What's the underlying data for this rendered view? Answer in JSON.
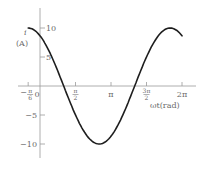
{
  "chart_data": {
    "type": "line",
    "title": "",
    "xlabel": "ωt(rad)",
    "ylabel": "i (A)",
    "ylabel_symbol": "i",
    "ylabel_unit": "(A)",
    "function": "i = 10 cos(ωt + π/6)",
    "xlim": [
      -0.5236,
      6.2832
    ],
    "ylim": [
      -12,
      13
    ],
    "x_ticks": [
      {
        "value": -0.5236,
        "label": "−π/6",
        "num": "π",
        "den": "6",
        "neg": true
      },
      {
        "value": 0,
        "label": "0"
      },
      {
        "value": 1.5708,
        "label": "π/2",
        "num": "π",
        "den": "2"
      },
      {
        "value": 3.1416,
        "label": "π"
      },
      {
        "value": 4.7124,
        "label": "3π/2",
        "num": "3π",
        "den": "2"
      },
      {
        "value": 6.2832,
        "label": "2π"
      }
    ],
    "y_ticks": [
      {
        "value": 10,
        "label": "10"
      },
      {
        "value": 5,
        "label": "5"
      },
      {
        "value": -5,
        "label": "−5"
      },
      {
        "value": -10,
        "label": "−10"
      }
    ],
    "series": [
      {
        "name": "i",
        "amplitude": 10,
        "phase": 0.5236,
        "x": [
          -0.5236,
          0,
          0.5236,
          1.0472,
          1.5708,
          2.0944,
          2.618,
          3.1416,
          3.6652,
          4.1888,
          4.7124,
          5.236,
          5.7596,
          6.2832
        ],
        "values": [
          10,
          8.66,
          5,
          0,
          -5,
          -8.66,
          -10,
          -8.66,
          -5,
          0,
          5,
          8.66,
          10,
          8.66
        ]
      }
    ],
    "grid": false,
    "legend": null,
    "colors": {
      "curve": "#1e1e1e",
      "axis": "#9a9a9a",
      "text": "#6a6a6a"
    }
  }
}
